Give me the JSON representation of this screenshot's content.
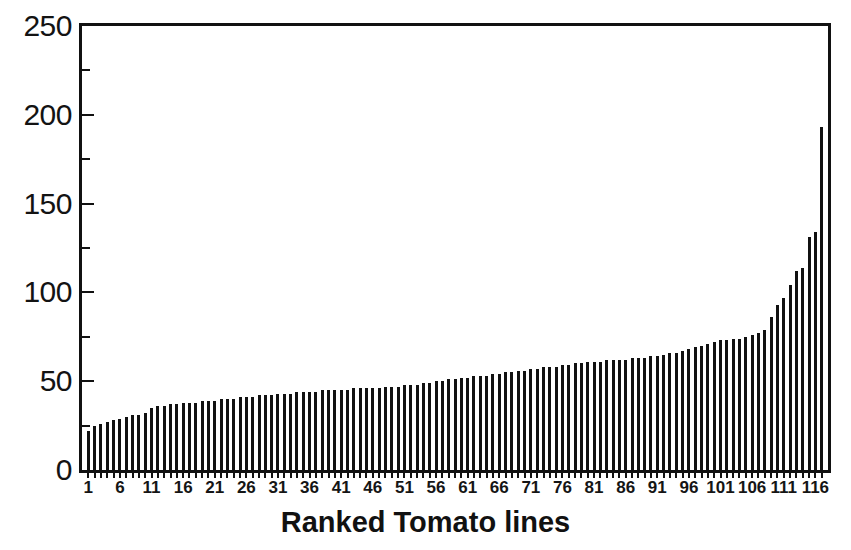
{
  "chart_data": {
    "type": "bar",
    "title": "",
    "xlabel": "Ranked Tomato lines",
    "ylabel": "",
    "ylim": [
      0,
      250
    ],
    "xlim": [
      0.5,
      117.5
    ],
    "grid": false,
    "legend": null,
    "y_major_ticks": [
      0,
      50,
      100,
      150,
      200,
      250
    ],
    "y_minor_ticks": [
      25,
      75,
      125,
      175,
      225
    ],
    "y_tick_labels": [
      "0",
      "50",
      "100",
      "150",
      "200",
      "250"
    ],
    "x_tick_labels": [
      "1",
      "6",
      "11",
      "16",
      "21",
      "26",
      "31",
      "36",
      "41",
      "46",
      "51",
      "56",
      "61",
      "66",
      "71",
      "76",
      "81",
      "86",
      "91",
      "96",
      "101",
      "106",
      "111",
      "116"
    ],
    "x_tick_positions": [
      1,
      6,
      11,
      16,
      21,
      26,
      31,
      36,
      41,
      46,
      51,
      56,
      61,
      66,
      71,
      76,
      81,
      86,
      91,
      96,
      101,
      106,
      111,
      116
    ],
    "bar_color": "#111111",
    "frame_color": "#111111",
    "background_color": "#ffffff",
    "n_bars": 117,
    "categories": [
      1,
      2,
      3,
      4,
      5,
      6,
      7,
      8,
      9,
      10,
      11,
      12,
      13,
      14,
      15,
      16,
      17,
      18,
      19,
      20,
      21,
      22,
      23,
      24,
      25,
      26,
      27,
      28,
      29,
      30,
      31,
      32,
      33,
      34,
      35,
      36,
      37,
      38,
      39,
      40,
      41,
      42,
      43,
      44,
      45,
      46,
      47,
      48,
      49,
      50,
      51,
      52,
      53,
      54,
      55,
      56,
      57,
      58,
      59,
      60,
      61,
      62,
      63,
      64,
      65,
      66,
      67,
      68,
      69,
      70,
      71,
      72,
      73,
      74,
      75,
      76,
      77,
      78,
      79,
      80,
      81,
      82,
      83,
      84,
      85,
      86,
      87,
      88,
      89,
      90,
      91,
      92,
      93,
      94,
      95,
      96,
      97,
      98,
      99,
      100,
      101,
      102,
      103,
      104,
      105,
      106,
      107,
      108,
      109,
      110,
      111,
      112,
      113,
      114,
      115,
      116,
      117
    ],
    "values": [
      22,
      25,
      26,
      27,
      28,
      29,
      30,
      31,
      31,
      32,
      35,
      36,
      36,
      37,
      37,
      38,
      38,
      38,
      39,
      39,
      39,
      40,
      40,
      40,
      41,
      41,
      41,
      42,
      42,
      42,
      43,
      43,
      43,
      44,
      44,
      44,
      44,
      45,
      45,
      45,
      45,
      45,
      46,
      46,
      46,
      46,
      46,
      47,
      47,
      47,
      48,
      48,
      48,
      49,
      49,
      50,
      50,
      51,
      51,
      52,
      52,
      53,
      53,
      53,
      54,
      54,
      55,
      55,
      56,
      56,
      57,
      57,
      58,
      58,
      58,
      59,
      59,
      60,
      60,
      61,
      61,
      61,
      62,
      62,
      62,
      62,
      63,
      63,
      63,
      64,
      64,
      65,
      66,
      66,
      67,
      68,
      69,
      70,
      71,
      72,
      73,
      73,
      74,
      74,
      75,
      76,
      77,
      79,
      86,
      93,
      97,
      104,
      112,
      114,
      131,
      134,
      193
    ]
  }
}
